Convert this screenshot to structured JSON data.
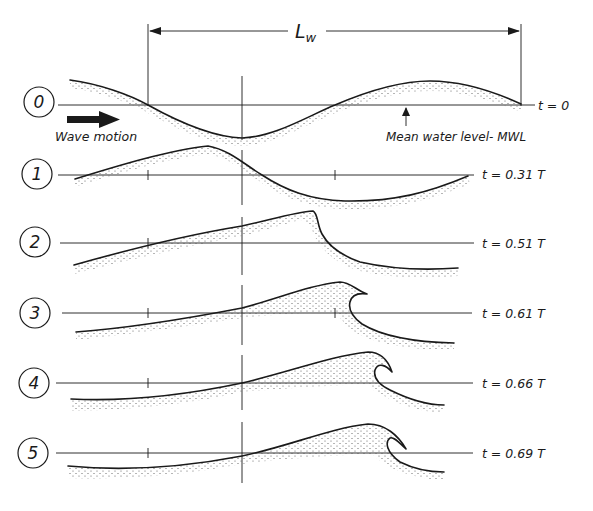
{
  "figure": {
    "type": "wave breaking sequence (plunging breaker)",
    "wavelength_label": "L",
    "wavelength_subscript": "w",
    "wave_motion_label": "Wave motion",
    "mwl_label": "Mean water level- MWL",
    "colors": {
      "ink": "#1a1a1a",
      "background": "#ffffff",
      "stipple": "#555555"
    }
  },
  "stages": [
    {
      "number": "0",
      "time_label": "t = 0"
    },
    {
      "number": "1",
      "time_label": "t = 0.31 T"
    },
    {
      "number": "2",
      "time_label": "t = 0.51 T"
    },
    {
      "number": "3",
      "time_label": "t = 0.61 T"
    },
    {
      "number": "4",
      "time_label": "t = 0.66 T"
    },
    {
      "number": "5",
      "time_label": "t = 0.69 T"
    }
  ]
}
